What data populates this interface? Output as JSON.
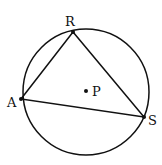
{
  "diagram": {
    "circle": {
      "cx": 86,
      "cy": 92,
      "r": 63
    },
    "center": {
      "name": "P",
      "x": 86,
      "y": 91
    },
    "points": [
      {
        "name": "R",
        "x": 73,
        "y": 32,
        "label_x": 69,
        "label_y": 25
      },
      {
        "name": "A",
        "x": 21,
        "y": 99,
        "label_x": 8,
        "label_y": 108
      },
      {
        "name": "S",
        "x": 144,
        "y": 117,
        "label_x": 148,
        "label_y": 125
      }
    ],
    "segments": [
      [
        "R",
        "A"
      ],
      [
        "R",
        "S"
      ],
      [
        "A",
        "S"
      ]
    ],
    "labels": {
      "R": "R",
      "A": "A",
      "S": "S",
      "P": "P"
    },
    "stroke_color": "#111111"
  }
}
